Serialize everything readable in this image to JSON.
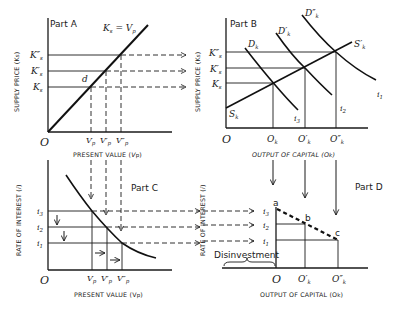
{
  "figure": {
    "panels": {
      "part_a": {
        "title": "Part A",
        "curve_label": "Ks = Vp",
        "y_axis_label": "SUPPLY PRICE (Ks)",
        "x_axis_label": "PRESENT VALUE (Vp)",
        "origin": "O",
        "point_label": "d",
        "y_ticks": [
          "K\"s",
          "K's",
          "Ks"
        ],
        "x_ticks": [
          "Vp",
          "V'p",
          "V\"p"
        ]
      },
      "part_b": {
        "title": "Part B",
        "y_axis_label": "SUPPLY PRICE (Ks)",
        "x_axis_label": "OUTPUT OF CAPITAL (Ok)",
        "origin": "O",
        "supply_start_label": "Sk",
        "supply_end_label": "S'k",
        "demand_labels": [
          "Dk",
          "D'k",
          "D\"k"
        ],
        "demand_end_labels": [
          "i3",
          "i2",
          "i1"
        ],
        "y_ticks": [
          "K\"s",
          "K's",
          "Ks"
        ],
        "x_ticks": [
          "Ok",
          "O'k",
          "O\"k"
        ]
      },
      "part_c": {
        "title": "Part C",
        "y_axis_label": "RATE OF INTEREST (i)",
        "x_axis_label": "PRESENT VALUE (Vp)",
        "origin": "O",
        "y_ticks": [
          "i3",
          "i2",
          "i1"
        ],
        "x_ticks": [
          "Vp",
          "V'p",
          "V\"p"
        ]
      },
      "part_d": {
        "title": "Part D",
        "y_axis_label": "RATE OF INTEREST (i)",
        "x_axis_label": "OUTPUT OF CAPITAL (Ok)",
        "origin": "O",
        "points": [
          "a",
          "b",
          "c"
        ],
        "y_ticks": [
          "i3",
          "i2",
          "i1"
        ],
        "x_ticks": [
          "O'k",
          "O\"k"
        ],
        "brace_label": "Disinvestment"
      }
    }
  }
}
